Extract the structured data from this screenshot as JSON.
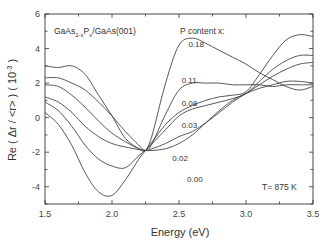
{
  "chart_data": {
    "type": "line",
    "title": "",
    "sample_label": "GaAs1-xPx/GaAs(001)",
    "sample_label_parts": {
      "base": "GaAs",
      "sub1": "1-x",
      "mid": "P",
      "sub2": "x",
      "tail": "/GaAs(001)"
    },
    "legend_title": "P content x:",
    "temperature_annotation": "T= 875 K",
    "xlabel": "Energy (eV)",
    "ylabel": "Re ( Δr / <r> ) ( 10",
    "ylabel_exp": "-3",
    "ylabel_tail": " )",
    "xlim": [
      1.5,
      3.5
    ],
    "ylim": [
      -5,
      6
    ],
    "xticks": [
      1.5,
      2.0,
      2.5,
      3.0,
      3.5
    ],
    "xtick_labels": [
      "1.5",
      "2.0",
      "2.5",
      "3.0",
      "3.5"
    ],
    "yticks": [
      -4,
      -2,
      0,
      2,
      4,
      6
    ],
    "ytick_labels": [
      "-4",
      "-2",
      "0",
      "2",
      "4",
      "6"
    ],
    "grid": false,
    "x": [
      1.5,
      1.6,
      1.7,
      1.8,
      1.9,
      2.0,
      2.1,
      2.2,
      2.25,
      2.3,
      2.4,
      2.5,
      2.6,
      2.7,
      2.8,
      2.9,
      3.0,
      3.1,
      3.2,
      3.3,
      3.4,
      3.5
    ],
    "series": [
      {
        "name": "0.00",
        "values": [
          0.3,
          -0.4,
          -1.6,
          -3.2,
          -4.3,
          -4.5,
          -3.6,
          -2.4,
          -1.9,
          -1.4,
          -0.4,
          0.3,
          0.7,
          1.0,
          1.2,
          1.3,
          1.5,
          2.5,
          3.6,
          4.5,
          4.8,
          4.7
        ]
      },
      {
        "name": "0.02",
        "values": [
          0.9,
          0.4,
          -0.5,
          -1.6,
          -2.4,
          -2.8,
          -2.9,
          -2.2,
          -1.9,
          -1.5,
          -0.7,
          0.1,
          0.5,
          0.7,
          0.9,
          1.1,
          1.4,
          2.1,
          2.8,
          3.3,
          3.6,
          3.6
        ]
      },
      {
        "name": "0.03",
        "values": [
          1.2,
          0.9,
          0.3,
          -0.5,
          -1.1,
          -1.5,
          -1.7,
          -1.85,
          -1.9,
          -1.8,
          -1.5,
          -1.1,
          -0.8,
          -0.3,
          0.3,
          0.9,
          1.4,
          1.9,
          2.4,
          2.8,
          3.1,
          3.2
        ]
      },
      {
        "name": "0.08",
        "values": [
          1.9,
          1.8,
          1.3,
          0.6,
          -0.2,
          -0.9,
          -1.4,
          -1.8,
          -1.9,
          -1.9,
          -1.8,
          -1.5,
          -1.0,
          -0.3,
          0.4,
          1.0,
          1.4,
          1.7,
          1.9,
          2.1,
          2.1,
          2.0
        ]
      },
      {
        "name": "0.11",
        "values": [
          2.3,
          2.3,
          2.0,
          1.6,
          0.9,
          0.1,
          -0.8,
          -1.6,
          -1.9,
          -1.5,
          0.2,
          1.6,
          2.0,
          2.0,
          2.0,
          1.9,
          1.9,
          1.9,
          1.8,
          1.9,
          1.9,
          1.9
        ]
      },
      {
        "name": "0.18",
        "values": [
          3.0,
          2.9,
          3.0,
          2.5,
          1.3,
          0.1,
          -1.2,
          -1.8,
          -1.9,
          -1.0,
          2.0,
          4.2,
          4.6,
          4.3,
          3.9,
          3.5,
          3.1,
          2.6,
          2.2,
          1.8,
          1.6,
          1.8
        ]
      }
    ],
    "curve_labels": [
      {
        "text": "0.18",
        "x": 2.57,
        "y": 4.1
      },
      {
        "text": "0.11",
        "x": 2.52,
        "y": 2.0
      },
      {
        "text": "0.08",
        "x": 2.52,
        "y": 0.65
      },
      {
        "text": "0.03",
        "x": 2.52,
        "y": -0.6
      },
      {
        "text": "0.02",
        "x": 2.45,
        "y": -2.5
      },
      {
        "text": "0.00",
        "x": 2.56,
        "y": -3.75
      }
    ],
    "legend_position": "top-center"
  }
}
